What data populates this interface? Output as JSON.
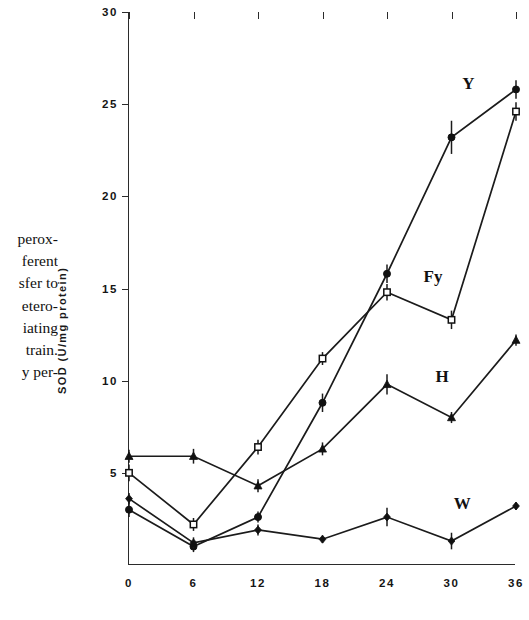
{
  "caption": {
    "lines": [
      "perox-",
      "ferent",
      "sfer to",
      "etero-",
      "iating",
      "train.",
      "y per-"
    ]
  },
  "axis": {
    "ylabel": "SOD (U/mg protein)",
    "yticks": [
      "30",
      "25",
      "20",
      "15",
      "10",
      "5"
    ],
    "xticks": [
      "0",
      "6",
      "12",
      "18",
      "24",
      "30",
      "36"
    ]
  },
  "chart_data": {
    "type": "line",
    "title": "",
    "xlabel": "",
    "ylabel": "SOD (U/mg protein)",
    "xlim": [
      0,
      36
    ],
    "ylim": [
      0,
      30
    ],
    "grid": false,
    "legend": "inline-labels",
    "x": [
      0,
      6,
      12,
      18,
      24,
      30,
      36
    ],
    "series": [
      {
        "name": "Y",
        "label": "Y",
        "marker": "filled-circle",
        "values": [
          3.0,
          1.0,
          2.6,
          8.8,
          15.8,
          23.2,
          25.8
        ],
        "errors": [
          0.4,
          0.3,
          0.3,
          0.5,
          0.5,
          0.9,
          0.5
        ],
        "label_pos": {
          "x": 31.0,
          "y": 26.1
        }
      },
      {
        "name": "Fy",
        "label": "Fy",
        "marker": "open-square",
        "values": [
          5.0,
          2.2,
          6.4,
          11.2,
          14.8,
          13.3,
          24.6
        ],
        "errors": [
          0.45,
          0.35,
          0.4,
          0.35,
          0.45,
          0.5,
          0.5
        ],
        "label_pos": {
          "x": 27.4,
          "y": 15.6
        }
      },
      {
        "name": "H",
        "label": "H",
        "marker": "filled-triangle",
        "values": [
          5.9,
          5.9,
          4.3,
          6.3,
          9.8,
          8.0,
          12.2
        ],
        "errors": [
          0.35,
          0.4,
          0.35,
          0.35,
          0.55,
          0.3,
          0.3
        ],
        "label_pos": {
          "x": 28.5,
          "y": 10.2
        }
      },
      {
        "name": "W",
        "label": "W",
        "marker": "filled-diamond",
        "values": [
          3.6,
          1.2,
          1.9,
          1.4,
          2.6,
          1.3,
          3.2
        ],
        "errors": [
          0.3,
          0.3,
          0.3,
          0.2,
          0.5,
          0.45,
          0.2
        ],
        "label_pos": {
          "x": 30.2,
          "y": 3.3
        }
      }
    ]
  }
}
